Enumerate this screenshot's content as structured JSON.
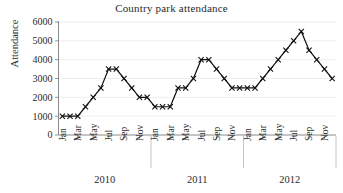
{
  "chart_data": {
    "type": "line",
    "title": "Country park attendance",
    "xlabel": "",
    "ylabel": "Attendance",
    "ylim": [
      0,
      6000
    ],
    "yticks": [
      0,
      1000,
      2000,
      3000,
      4000,
      5000,
      6000
    ],
    "ytick_labels": [
      "0",
      "1000",
      "2000",
      "3000",
      "4000",
      "5000",
      "6000"
    ],
    "grid": true,
    "legend": "none",
    "marker": "x",
    "line_color": "#111111",
    "grid_color": "#e8e8e8",
    "axis_color": "#8a8a8a",
    "xtick_labels": [
      "Jan",
      "Mar",
      "May",
      "Jul",
      "Sep",
      "Nov"
    ],
    "group_labels": [
      "2010",
      "2011",
      "2012"
    ],
    "categories": [
      "Jan 2010",
      "Feb 2010",
      "Mar 2010",
      "Apr 2010",
      "May 2010",
      "Jun 2010",
      "Jul 2010",
      "Aug 2010",
      "Sep 2010",
      "Oct 2010",
      "Nov 2010",
      "Dec 2010",
      "Jan 2011",
      "Feb 2011",
      "Mar 2011",
      "Apr 2011",
      "May 2011",
      "Jun 2011",
      "Jul 2011",
      "Aug 2011",
      "Sep 2011",
      "Oct 2011",
      "Nov 2011",
      "Dec 2011",
      "Jan 2012",
      "Feb 2012",
      "Mar 2012",
      "Apr 2012",
      "May 2012",
      "Jun 2012",
      "Jul 2012",
      "Aug 2012",
      "Sep 2012",
      "Oct 2012",
      "Nov 2012",
      "Dec 2012"
    ],
    "values": [
      1000,
      1000,
      1000,
      1500,
      2000,
      2500,
      3500,
      3500,
      3000,
      2500,
      2000,
      2000,
      1500,
      1500,
      1500,
      2500,
      2500,
      3000,
      4000,
      4000,
      3500,
      3000,
      2500,
      2500,
      2500,
      2500,
      3000,
      3500,
      4000,
      4500,
      5000,
      5500,
      4500,
      4000,
      3500,
      3000
    ]
  }
}
